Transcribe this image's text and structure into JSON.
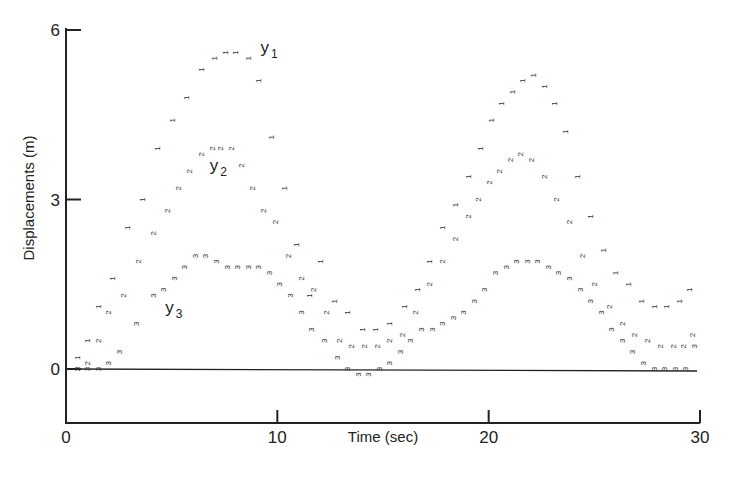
{
  "chart_data": {
    "type": "scatter",
    "title": "",
    "xlabel": "Time (sec)",
    "ylabel": "Displacements (m)",
    "xlim": [
      0,
      30
    ],
    "ylim": [
      -1,
      6.3
    ],
    "x_ticks": [
      0,
      10,
      20,
      30
    ],
    "y_ticks": [
      0,
      3,
      6
    ],
    "grid": false,
    "legend": "inline labels y1, y2, y3",
    "marker_style": "series digit characters ('1','2','3') rotated 90 degrees",
    "series": [
      {
        "name": "y1",
        "marker": "1",
        "label_pos": {
          "x": 9.2,
          "y": 5.6
        },
        "x": [
          0.5,
          1.0,
          1.5,
          2.2,
          2.9,
          3.6,
          4.3,
          5.0,
          5.7,
          6.4,
          7.0,
          7.5,
          8.0,
          8.6,
          9.1,
          9.7,
          10.3,
          10.9,
          11.5,
          12.0,
          12.7,
          13.3,
          14.0,
          14.6,
          15.3,
          16.0,
          16.6,
          17.2,
          17.8,
          18.4,
          19.0,
          19.6,
          20.1,
          20.6,
          21.1,
          21.6,
          22.1,
          22.6,
          23.1,
          23.6,
          24.2,
          24.8,
          25.4,
          26.0,
          26.6,
          27.2,
          27.8,
          28.4,
          29.0,
          29.5
        ],
        "values": [
          0.2,
          0.5,
          1.1,
          1.6,
          2.5,
          3.0,
          3.9,
          4.4,
          4.8,
          5.3,
          5.5,
          5.6,
          5.6,
          5.5,
          5.1,
          4.1,
          3.2,
          2.2,
          1.3,
          1.9,
          1.2,
          1.0,
          0.7,
          0.7,
          0.8,
          1.1,
          1.4,
          1.9,
          2.5,
          2.9,
          3.4,
          3.9,
          4.4,
          4.7,
          4.9,
          5.1,
          5.2,
          5.0,
          4.7,
          4.2,
          3.4,
          2.7,
          2.1,
          1.7,
          1.5,
          1.2,
          1.1,
          1.1,
          1.2,
          1.4
        ]
      },
      {
        "name": "y2",
        "marker": "2",
        "label_pos": {
          "x": 6.8,
          "y": 3.5
        },
        "x": [
          0.5,
          1.0,
          1.5,
          2.0,
          2.7,
          3.4,
          4.1,
          4.8,
          5.3,
          5.8,
          6.4,
          6.9,
          7.3,
          7.8,
          8.3,
          8.8,
          9.3,
          9.9,
          10.5,
          11.1,
          11.7,
          12.3,
          12.9,
          13.5,
          14.1,
          14.7,
          15.3,
          15.9,
          16.5,
          17.2,
          17.8,
          18.4,
          19.0,
          19.5,
          20.0,
          20.5,
          21.0,
          21.5,
          22.0,
          22.6,
          23.2,
          23.8,
          24.4,
          25.0,
          25.7,
          26.3,
          26.9,
          27.5,
          28.1,
          28.7,
          29.2,
          29.6
        ],
        "values": [
          0.0,
          0.1,
          0.5,
          1.0,
          1.3,
          1.9,
          2.4,
          2.8,
          3.2,
          3.5,
          3.8,
          3.9,
          3.9,
          3.9,
          3.6,
          3.2,
          2.8,
          2.6,
          2.0,
          1.6,
          1.4,
          1.0,
          0.5,
          0.4,
          0.4,
          0.4,
          0.5,
          0.6,
          1.0,
          1.5,
          1.9,
          2.3,
          2.7,
          3.0,
          3.3,
          3.5,
          3.7,
          3.8,
          3.7,
          3.4,
          3.0,
          2.6,
          2.0,
          1.5,
          1.1,
          0.8,
          0.6,
          0.5,
          0.4,
          0.4,
          0.4,
          0.6
        ]
      },
      {
        "name": "y3",
        "marker": "3",
        "label_pos": {
          "x": 4.7,
          "y": 1.0
        },
        "x": [
          0.5,
          1.0,
          1.5,
          2.0,
          2.5,
          3.3,
          4.1,
          4.6,
          5.1,
          5.6,
          6.1,
          6.6,
          7.1,
          7.6,
          8.1,
          8.6,
          9.1,
          9.6,
          10.1,
          10.6,
          11.1,
          11.6,
          12.2,
          12.8,
          13.3,
          13.8,
          14.3,
          14.8,
          15.3,
          15.8,
          16.3,
          16.8,
          17.3,
          17.8,
          18.3,
          18.8,
          19.3,
          19.8,
          20.3,
          20.8,
          21.3,
          21.8,
          22.3,
          22.8,
          23.3,
          23.8,
          24.3,
          24.8,
          25.3,
          25.8,
          26.3,
          26.8,
          27.3,
          27.8,
          28.3,
          28.8,
          29.3,
          29.7
        ],
        "values": [
          0.0,
          0.0,
          0.0,
          0.1,
          0.3,
          0.8,
          1.3,
          1.4,
          1.6,
          1.8,
          2.0,
          2.0,
          1.9,
          1.8,
          1.8,
          1.8,
          1.8,
          1.7,
          1.5,
          1.3,
          1.0,
          0.7,
          0.5,
          0.2,
          0.0,
          -0.1,
          -0.1,
          0.0,
          0.1,
          0.3,
          0.5,
          0.7,
          0.7,
          0.8,
          0.9,
          1.0,
          1.2,
          1.4,
          1.7,
          1.8,
          1.9,
          1.9,
          1.9,
          1.8,
          1.7,
          1.6,
          1.4,
          1.2,
          1.0,
          0.7,
          0.5,
          0.3,
          0.1,
          0.0,
          0.0,
          0.0,
          0.0,
          0.4
        ]
      }
    ]
  },
  "axes": {
    "x_title": "Time (sec)",
    "y_title": "Displacements (m)",
    "x_tick_labels": [
      "0",
      "10",
      "20",
      "30"
    ],
    "y_tick_labels": [
      "0",
      "3",
      "6"
    ]
  },
  "labels": {
    "y1": {
      "base": "y",
      "sub": "1"
    },
    "y2": {
      "base": "y",
      "sub": "2"
    },
    "y3": {
      "base": "y",
      "sub": "3"
    }
  },
  "colors": {
    "ink": "#222222",
    "marker": "#333333",
    "background": "#ffffff"
  }
}
